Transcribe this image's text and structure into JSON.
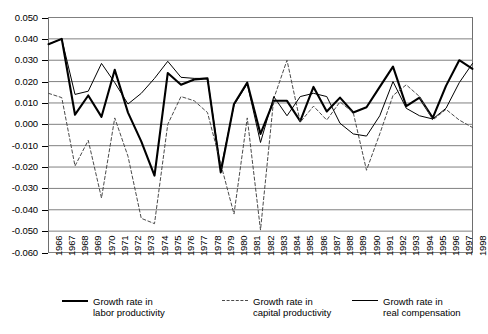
{
  "chart_data": {
    "type": "line",
    "title": "",
    "subtitle": "",
    "xlabel": "",
    "ylabel": "",
    "grid": true,
    "legend_position": "bottom",
    "ylim": [
      -0.06,
      0.05
    ],
    "ytick_step": 0.01,
    "ytick_labels": [
      "0.050",
      "0.040",
      "0.030",
      "0.020",
      "0.010",
      "0.000",
      "-0.010",
      "-0.020",
      "-0.030",
      "-0.040",
      "-0.050",
      "-0.060"
    ],
    "ytick_values": [
      0.05,
      0.04,
      0.03,
      0.02,
      0.01,
      0.0,
      -0.01,
      -0.02,
      -0.03,
      -0.04,
      -0.05,
      -0.06
    ],
    "categories": [
      "1966",
      "1967",
      "1968",
      "1969",
      "1970",
      "1971",
      "1972",
      "1973",
      "1974",
      "1975",
      "1976",
      "1977",
      "1978",
      "1979",
      "1980",
      "1981",
      "1982",
      "1983",
      "1984",
      "1985",
      "1986",
      "1987",
      "1988",
      "1989",
      "1990",
      "1991",
      "1992",
      "1993",
      "1994",
      "1995",
      "1996",
      "1997",
      "1998"
    ],
    "x": [
      1966,
      1967,
      1968,
      1969,
      1970,
      1971,
      1972,
      1973,
      1974,
      1975,
      1976,
      1977,
      1978,
      1979,
      1980,
      1981,
      1982,
      1983,
      1984,
      1985,
      1986,
      1987,
      1988,
      1989,
      1990,
      1991,
      1992,
      1993,
      1994,
      1995,
      1996,
      1997,
      1998
    ],
    "series": [
      {
        "name": "Growth rate in labor productivity",
        "style": "solid-thick",
        "color": "#000000",
        "values": [
          0.0375,
          0.04,
          0.0045,
          0.0135,
          0.0035,
          0.0255,
          0.0055,
          -0.008,
          -0.024,
          0.024,
          0.0185,
          0.021,
          0.0215,
          -0.0225,
          0.0095,
          0.0195,
          -0.0045,
          0.011,
          0.011,
          0.0015,
          0.0175,
          0.006,
          0.0125,
          0.0055,
          0.008,
          0.0175,
          0.027,
          0.0085,
          0.0125,
          0.003,
          0.018,
          0.03,
          0.026
        ]
      },
      {
        "name": "Growth rate in capital productivity",
        "style": "dashed",
        "color": "#4a4a4a",
        "values": [
          0.0145,
          0.0125,
          -0.0195,
          -0.0075,
          -0.0345,
          0.003,
          -0.015,
          -0.044,
          -0.0465,
          0.0,
          0.013,
          0.011,
          0.0055,
          -0.0185,
          -0.042,
          0.003,
          -0.0495,
          0.012,
          0.03,
          0.001,
          0.0085,
          0.002,
          0.0105,
          0.0055,
          -0.0215,
          -0.0045,
          0.0135,
          0.0185,
          0.013,
          0.002,
          0.007,
          0.002,
          -0.0015
        ]
      },
      {
        "name": "Growth rate in real compensation",
        "style": "solid-thin",
        "color": "#000000",
        "values": [
          0.0375,
          0.04,
          0.014,
          0.0155,
          0.0285,
          0.0195,
          0.0095,
          0.0145,
          0.0215,
          0.0295,
          0.022,
          0.0215,
          0.0215,
          -0.021,
          0.009,
          0.019,
          -0.0085,
          0.013,
          0.004,
          0.013,
          0.0145,
          0.013,
          0.0005,
          -0.0045,
          -0.0055,
          0.004,
          0.02,
          0.0075,
          0.004,
          0.0025,
          0.0075,
          0.0195,
          0.0285
        ]
      }
    ]
  },
  "legend": {
    "entries": [
      {
        "line1": "Growth rate in",
        "line2": "labor productivity",
        "style": "solid-thick"
      },
      {
        "line1": "Growth rate in",
        "line2": "capital productivity",
        "style": "dashed"
      },
      {
        "line1": "Growth rate in",
        "line2": "real compensation",
        "style": "solid-thin"
      }
    ]
  }
}
